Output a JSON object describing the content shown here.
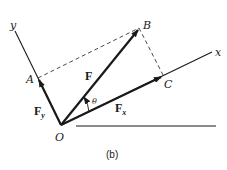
{
  "diagram": {
    "caption": "(b)",
    "axes": {
      "x_label": "x",
      "y_label": "y"
    },
    "points": {
      "origin": "O",
      "a": "A",
      "b": "B",
      "c": "C"
    },
    "vectors": {
      "force": {
        "label": "F"
      },
      "force_x": {
        "label": "F",
        "subscript": "x"
      },
      "force_y": {
        "label": "F",
        "subscript": "y"
      }
    },
    "angle_label": "θ",
    "colors": {
      "ink": "#1a1a1a",
      "background": "#ffffff"
    }
  }
}
